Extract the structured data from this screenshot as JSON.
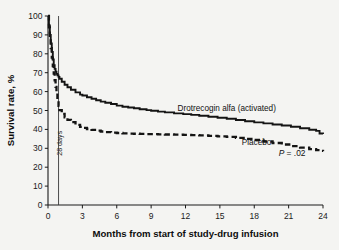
{
  "chart_data": {
    "type": "line",
    "title": "",
    "subtitle": "",
    "xlabel": "Months from start of study-drug infusion",
    "ylabel": "Survival rate, %",
    "xlim": [
      0,
      24
    ],
    "ylim": [
      0,
      100
    ],
    "xticks": [
      0,
      3,
      6,
      9,
      12,
      15,
      18,
      21,
      24
    ],
    "xticklabels": [
      "0",
      "3",
      "6",
      "9",
      "12",
      "15",
      "18",
      "21",
      "24"
    ],
    "yticks": [
      0,
      10,
      20,
      30,
      40,
      50,
      60,
      70,
      80,
      90,
      100
    ],
    "yticklabels": [
      "0",
      "10",
      "20",
      "30",
      "40",
      "50",
      "60",
      "70",
      "80",
      "90",
      "100"
    ],
    "grid": false,
    "legend_position": "inline-annotations",
    "annotations": [
      {
        "name": "reference-line-28-days",
        "text": "28 days",
        "x": 0.92,
        "kind": "vline"
      },
      {
        "name": "series-label-treatment",
        "text": "Drotrecogin alfa (activated)",
        "x": 15.6,
        "y": 49.5
      },
      {
        "name": "series-label-placebo",
        "text": "Placebo",
        "x": 18.2,
        "y": 31.5
      },
      {
        "name": "p-value-annotation",
        "text": "P = .02",
        "p_symbol": "P",
        "p_rest": " = .02",
        "x": 21.3,
        "y": 26.0
      }
    ],
    "series": [
      {
        "name": "Drotrecogin alfa (activated)",
        "style": "solid",
        "color": "#141414",
        "points": [
          [
            0.0,
            100.0
          ],
          [
            0.08,
            95.0
          ],
          [
            0.16,
            90.0
          ],
          [
            0.24,
            85.5
          ],
          [
            0.33,
            81.0
          ],
          [
            0.42,
            77.0
          ],
          [
            0.5,
            74.0
          ],
          [
            0.58,
            72.0
          ],
          [
            0.66,
            70.5
          ],
          [
            0.74,
            69.4
          ],
          [
            0.82,
            68.6
          ],
          [
            0.92,
            67.8
          ],
          [
            1.0,
            66.8
          ],
          [
            1.2,
            65.2
          ],
          [
            1.45,
            63.6
          ],
          [
            1.7,
            62.3
          ],
          [
            2.0,
            61.0
          ],
          [
            2.4,
            59.6
          ],
          [
            2.8,
            58.4
          ],
          [
            3.0,
            57.9
          ],
          [
            3.4,
            57.0
          ],
          [
            3.8,
            56.2
          ],
          [
            4.2,
            55.4
          ],
          [
            4.6,
            54.7
          ],
          [
            5.0,
            54.1
          ],
          [
            5.5,
            53.4
          ],
          [
            6.0,
            52.6
          ],
          [
            6.5,
            52.0
          ],
          [
            7.0,
            51.6
          ],
          [
            7.5,
            51.2
          ],
          [
            8.0,
            50.7
          ],
          [
            8.6,
            50.2
          ],
          [
            9.0,
            49.9
          ],
          [
            9.6,
            49.4
          ],
          [
            10.2,
            49.0
          ],
          [
            11.0,
            48.5
          ],
          [
            11.8,
            48.1
          ],
          [
            12.5,
            47.7
          ],
          [
            13.2,
            47.2
          ],
          [
            14.0,
            46.7
          ],
          [
            14.8,
            46.2
          ],
          [
            15.6,
            45.6
          ],
          [
            16.4,
            45.0
          ],
          [
            17.2,
            44.3
          ],
          [
            18.0,
            43.7
          ],
          [
            18.8,
            43.2
          ],
          [
            19.6,
            42.6
          ],
          [
            20.4,
            42.1
          ],
          [
            21.2,
            41.4
          ],
          [
            22.0,
            40.6
          ],
          [
            22.8,
            39.8
          ],
          [
            23.4,
            39.2
          ],
          [
            23.7,
            37.8
          ],
          [
            24.0,
            37.6
          ]
        ]
      },
      {
        "name": "Placebo",
        "style": "dashed",
        "color": "#141414",
        "points": [
          [
            0.0,
            100.0
          ],
          [
            0.08,
            94.0
          ],
          [
            0.16,
            88.5
          ],
          [
            0.24,
            83.0
          ],
          [
            0.33,
            78.0
          ],
          [
            0.42,
            73.5
          ],
          [
            0.5,
            69.5
          ],
          [
            0.58,
            66.0
          ],
          [
            0.66,
            62.5
          ],
          [
            0.74,
            59.0
          ],
          [
            0.82,
            55.5
          ],
          [
            0.92,
            52.5
          ],
          [
            1.0,
            50.2
          ],
          [
            1.2,
            48.2
          ],
          [
            1.45,
            46.4
          ],
          [
            1.7,
            45.0
          ],
          [
            2.0,
            43.8
          ],
          [
            2.4,
            42.4
          ],
          [
            2.8,
            41.3
          ],
          [
            3.0,
            40.8
          ],
          [
            3.4,
            40.2
          ],
          [
            3.8,
            39.7
          ],
          [
            4.2,
            39.3
          ],
          [
            4.6,
            38.9
          ],
          [
            5.0,
            38.6
          ],
          [
            5.5,
            38.3
          ],
          [
            6.0,
            38.1
          ],
          [
            6.5,
            37.9
          ],
          [
            7.0,
            37.8
          ],
          [
            7.5,
            37.7
          ],
          [
            8.0,
            37.6
          ],
          [
            8.6,
            37.5
          ],
          [
            9.0,
            37.5
          ],
          [
            9.6,
            37.4
          ],
          [
            10.2,
            37.3
          ],
          [
            11.0,
            37.2
          ],
          [
            11.8,
            37.1
          ],
          [
            12.5,
            37.0
          ],
          [
            13.2,
            36.8
          ],
          [
            14.0,
            36.6
          ],
          [
            14.8,
            36.3
          ],
          [
            15.6,
            36.0
          ],
          [
            16.4,
            35.5
          ],
          [
            17.2,
            35.0
          ],
          [
            18.0,
            34.4
          ],
          [
            18.8,
            33.6
          ],
          [
            19.6,
            32.8
          ],
          [
            20.4,
            32.0
          ],
          [
            21.2,
            31.2
          ],
          [
            22.0,
            30.4
          ],
          [
            22.8,
            29.6
          ],
          [
            23.4,
            29.0
          ],
          [
            23.7,
            28.6
          ],
          [
            24.0,
            28.4
          ]
        ]
      }
    ]
  },
  "colors": {
    "background": "#f4f4f2",
    "ink": "#141414",
    "reference_line": "#3a3a3a"
  }
}
